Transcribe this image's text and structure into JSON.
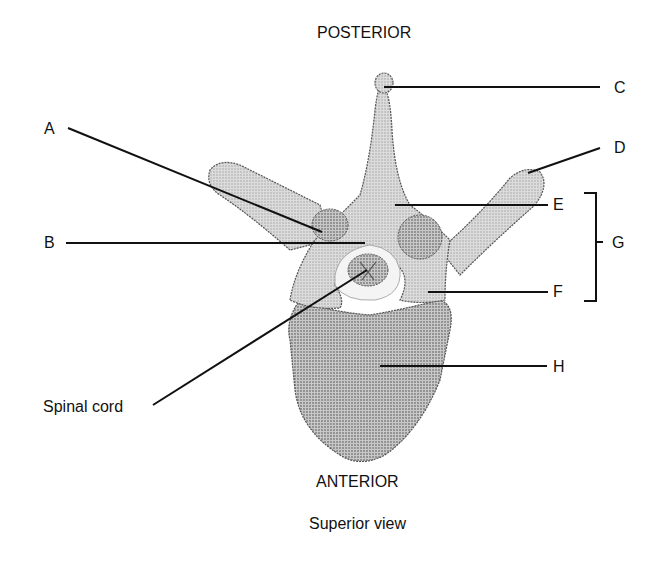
{
  "diagram": {
    "title": "Superior view",
    "orientation": {
      "top": "POSTERIOR",
      "bottom": "ANTERIOR"
    },
    "labels": {
      "A": "A",
      "B": "B",
      "C": "C",
      "D": "D",
      "E": "E",
      "F": "F",
      "G": "G",
      "H": "H",
      "spinal_cord": "Spinal cord"
    },
    "colors": {
      "bone_fill": "#d9d9d9",
      "bone_dark": "#b5b5b5",
      "outline": "#555555",
      "foramen": "#f4f4f4",
      "leader_line": "#111111"
    }
  }
}
